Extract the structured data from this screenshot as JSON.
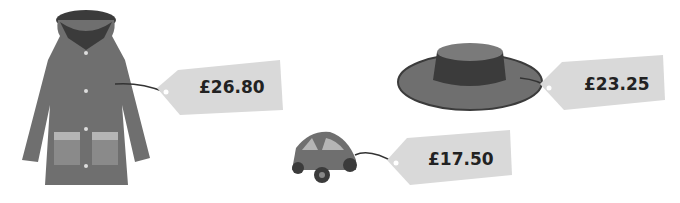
{
  "items": [
    {
      "name": "coat",
      "price": "£26.80"
    },
    {
      "name": "hat",
      "price": "£23.25"
    },
    {
      "name": "toy-car",
      "price": "£17.50"
    }
  ],
  "colors": {
    "tag": "#d9d9d9",
    "garment": "#6f6f6f",
    "dark": "#3b3b3b",
    "pocket_light": "#b5b5b5",
    "pocket": "#8a8a8a"
  }
}
